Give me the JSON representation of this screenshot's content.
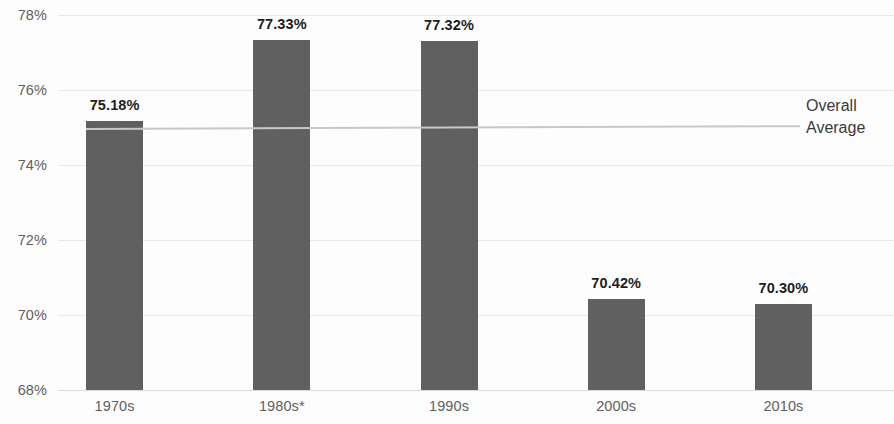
{
  "chart_data": {
    "type": "bar",
    "title": "",
    "subtitle": "",
    "xlabel": "",
    "ylabel": "",
    "categories": [
      "1970s",
      "1980s*",
      "1990s",
      "2000s",
      "2010s"
    ],
    "values": [
      75.18,
      77.33,
      77.32,
      70.42,
      70.3
    ],
    "value_labels": [
      "75.18%",
      "77.33%",
      "77.32%",
      "70.42%",
      "70.30%"
    ],
    "ylim": [
      68,
      78
    ],
    "y_ticks": [
      68,
      70,
      72,
      74,
      76,
      78
    ],
    "y_tick_labels": [
      "68%",
      "70%",
      "72%",
      "74%",
      "76%",
      "78%"
    ],
    "grid": true,
    "legend_position": "right-inline",
    "series": [
      {
        "name": "Percentage",
        "type": "bar",
        "color": "#606060",
        "values": [
          75.18,
          77.33,
          77.32,
          70.42,
          70.3
        ]
      },
      {
        "name": "Overall Average",
        "type": "line",
        "color": "#c8c8c6",
        "value": 75.05,
        "label_line1": "Overall",
        "label_line2": "Average"
      }
    ],
    "annotations": [
      {
        "text": "*",
        "attached_to": "1980s",
        "meaning": "footnote marker"
      }
    ]
  }
}
